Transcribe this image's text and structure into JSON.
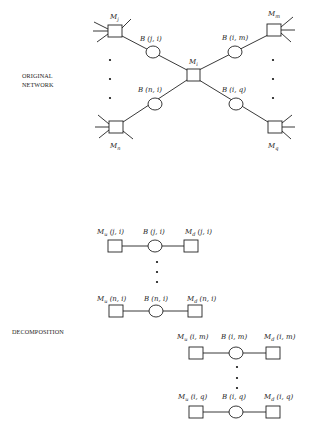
{
  "sections": {
    "original": {
      "caption_line1": "ORIGINAL",
      "caption_line2": "NETWORK",
      "machines": {
        "mj": {
          "name": "M",
          "sub": "j"
        },
        "mi": {
          "name": "M",
          "sub": "i"
        },
        "mm": {
          "name": "M",
          "sub": "m"
        },
        "mn": {
          "name": "M",
          "sub": "n"
        },
        "mq": {
          "name": "M",
          "sub": "q"
        }
      },
      "buffers": {
        "bji": "B (j, i)",
        "bim": "B (i, m)",
        "bni": "B (n, i)",
        "biq": "B (i, q)"
      }
    },
    "decomposition": {
      "caption": "DECOMPOSITION",
      "lines": [
        {
          "up_name": "M",
          "up_sub": "u",
          "up_args": " (j, i)",
          "buffer": "B (j, i)",
          "down_name": "M",
          "down_sub": "d",
          "down_args": " (j, i)"
        },
        {
          "up_name": "M",
          "up_sub": "u",
          "up_args": " (n, i)",
          "buffer": "B (n, i)",
          "down_name": "M",
          "down_sub": "d",
          "down_args": " (n, i)"
        },
        {
          "up_name": "M",
          "up_sub": "u",
          "up_args": " (i, m)",
          "buffer": "B (i, m)",
          "down_name": "M",
          "down_sub": "d",
          "down_args": " (i, m)"
        },
        {
          "up_name": "M",
          "up_sub": "u",
          "up_args": " (i, q)",
          "buffer": "B (i, q)",
          "down_name": "M",
          "down_sub": "d",
          "down_args": " (i, q)"
        }
      ]
    }
  }
}
